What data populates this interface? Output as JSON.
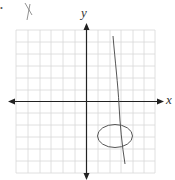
{
  "diagram": {
    "type": "coordinate-plane-sketch",
    "x_axis_label": "x",
    "y_axis_label": "y",
    "handwritten_mark": "X",
    "stray_dot": "•",
    "grid": {
      "rows": 12,
      "cols": 12
    },
    "shapes": [
      {
        "kind": "line",
        "description": "nearly vertical line crossing x-axis right of origin"
      },
      {
        "kind": "ellipse",
        "description": "ellipse in quadrant IV intersected by the line"
      }
    ],
    "colors": {
      "grid": "#d8d8d8",
      "axes": "#222222",
      "sketch": "#555555"
    }
  }
}
